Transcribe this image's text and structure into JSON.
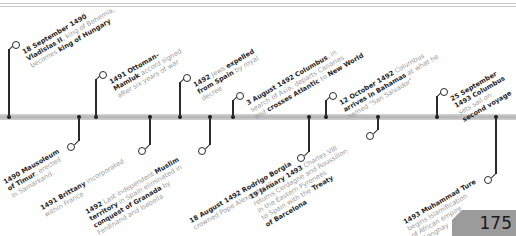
{
  "page": {
    "number": "175"
  },
  "events_above": [
    {
      "x": 9,
      "y": 43,
      "lines": [
        [
          {
            "b": "18 September 1490"
          }
        ],
        [
          {
            "b": "Vladislas II"
          },
          {
            "t": ", king of Bohemia,"
          }
        ],
        [
          {
            "t": "becomes "
          },
          {
            "b": "king of Hungary"
          }
        ]
      ]
    },
    {
      "x": 96,
      "y": 73,
      "lines": [
        [
          {
            "b": "1491 Ottoman–"
          }
        ],
        [
          {
            "b": "Mamluk"
          },
          {
            "t": " accord signed"
          }
        ],
        [
          {
            "t": "after six years of war"
          }
        ]
      ]
    },
    {
      "x": 180,
      "y": 76,
      "lines": [
        [
          {
            "b": "1492"
          },
          {
            "t": " Jews "
          },
          {
            "b": "expelled"
          }
        ],
        [
          {
            "b": "from Spain"
          },
          {
            "t": " by royal"
          }
        ],
        [
          {
            "t": "decree"
          }
        ]
      ]
    },
    {
      "x": 233,
      "y": 94,
      "lines": [
        [
          {
            "b": "3 August 1492 Columbus"
          },
          {
            "t": ", in"
          }
        ],
        [
          {
            "t": "search of Asia, departs Canaries"
          }
        ],
        [
          {
            "t": "and "
          },
          {
            "b": "crosses Atlantic"
          },
          {
            "t": " to "
          },
          {
            "b": "New World"
          }
        ]
      ]
    },
    {
      "x": 326,
      "y": 94,
      "lines": [
        [
          {
            "b": "12 October 1492"
          },
          {
            "t": " Columbus"
          }
        ],
        [
          {
            "b": "arrives in Bahamas"
          },
          {
            "t": " at what he"
          }
        ],
        [
          {
            "t": "named \"San Salvador\""
          }
        ]
      ]
    },
    {
      "x": 437,
      "y": 90,
      "lines": [
        [
          {
            "b": "25 September"
          }
        ],
        [
          {
            "b": "1493 Columbus"
          }
        ],
        [
          {
            "t": "sets sail on"
          }
        ],
        [
          {
            "b": "second voyage"
          }
        ]
      ]
    }
  ],
  "events_below": [
    {
      "x": 79,
      "y": 145,
      "lines": [
        [
          {
            "b": "1490 Mausoleum"
          }
        ],
        [
          {
            "b": "of Timur"
          },
          {
            "t": ", erected"
          }
        ],
        [
          {
            "t": "in Samarkand."
          }
        ]
      ]
    },
    {
      "x": 150,
      "y": 149,
      "lines": [
        [
          {
            "b": "1491 Brittany"
          },
          {
            "t": " incorporated"
          }
        ],
        [
          {
            "t": "within France"
          }
        ]
      ]
    },
    {
      "x": 210,
      "y": 149,
      "lines": [
        [
          {
            "b": "1492"
          },
          {
            "t": " Last independent "
          },
          {
            "b": "Muslim"
          }
        ],
        [
          {
            "b": "territory"
          },
          {
            "t": " in Spain eliminated in"
          }
        ],
        [
          {
            "b": "conquest of Granada"
          },
          {
            "t": " by"
          }
        ],
        [
          {
            "t": "Ferdinand and Isabella"
          }
        ]
      ]
    },
    {
      "x": 309,
      "y": 156,
      "lines": [
        [
          {
            "b": "18 August 1492 Rodrigo Borgia"
          }
        ],
        [
          {
            "t": "crowned Pope Alexander VI"
          }
        ]
      ]
    },
    {
      "x": 378,
      "y": 134,
      "lines": [
        [
          {
            "b": "19 January 1493"
          },
          {
            "t": " Charles VIII"
          }
        ],
        [
          {
            "t": "returns Cerdagne and Roussillon"
          }
        ],
        [
          {
            "t": "in the Eastern Pyrenees"
          }
        ],
        [
          {
            "t": "to Spain with the "
          },
          {
            "b": "Treaty"
          }
        ],
        [
          {
            "b": "of Barcelona"
          }
        ]
      ]
    },
    {
      "x": 496,
      "y": 178,
      "lines": [
        [
          {
            "b": "1493 Muhammad Ture"
          }
        ],
        [
          {
            "t": "begins Islamification"
          }
        ],
        [
          {
            "t": "of African empire"
          }
        ],
        [
          {
            "t": "of Songhay"
          }
        ]
      ]
    }
  ]
}
